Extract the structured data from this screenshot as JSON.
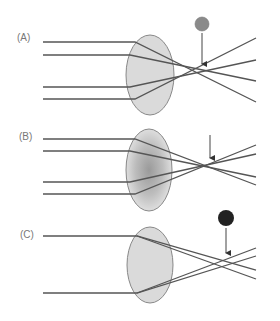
{
  "panels": [
    {
      "label": "(A)",
      "description": "Parallel rays converge at a single focal point; gray dot marks the focus",
      "marker": {
        "type": "circle",
        "color": "#8a8a8a",
        "cx": 202,
        "cy": 24,
        "r": 7
      },
      "lens": {
        "cx": 150,
        "cy": 75,
        "rx": 24,
        "ry": 40,
        "fill": "#dadada",
        "gradient": false
      }
    },
    {
      "label": "(B)",
      "description": "Rays converge at a single focal point; lens with shaded gradient",
      "marker": null,
      "lens": {
        "cx": 149,
        "cy": 170,
        "rx": 23,
        "ry": 41,
        "fill": "#d0d0d0",
        "gradient": true
      }
    },
    {
      "label": "(C)",
      "description": "Rays cross at multiple points; black dot marks the region",
      "marker": {
        "type": "circle",
        "color": "#222222",
        "cx": 226,
        "cy": 218,
        "r": 8
      },
      "lens": {
        "cx": 150,
        "cy": 265,
        "rx": 23,
        "ry": 38,
        "fill": "#dadada",
        "gradient": false
      }
    }
  ],
  "colors": {
    "ray": "#555555",
    "lens_stroke": "#888888",
    "label": "#777777",
    "arrow": "#444444"
  }
}
